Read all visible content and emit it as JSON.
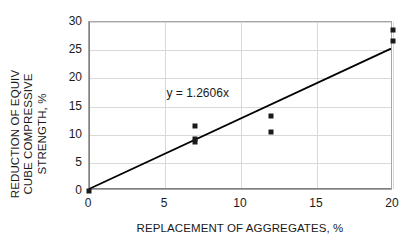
{
  "chart_data": {
    "type": "scatter",
    "title": "",
    "xlabel": "REPLACEMENT OF AGGREGATES, %",
    "ylabel": "REDUCTION OF EQUIV CUBE COMPRESSIVE STRENGTH, %",
    "ylabel_lines": [
      "REDUCTION OF EQUIV",
      "CUBE COMPRESSIVE",
      "STRENGTH, %"
    ],
    "xlim": [
      0,
      20
    ],
    "ylim": [
      0,
      30
    ],
    "xticks": [
      0,
      5,
      10,
      15,
      20
    ],
    "yticks": [
      0,
      5,
      10,
      15,
      20,
      25,
      30
    ],
    "xtick_labels": [
      "0",
      "5",
      "10",
      "15",
      "20"
    ],
    "ytick_labels": [
      "0",
      "5",
      "10",
      "15",
      "20",
      "25",
      "30"
    ],
    "grid": true,
    "legend": "none",
    "marker_color": "#1a1a1a",
    "line_color": "#000000",
    "grid_color": "#d9d9d9",
    "frame_color": "#a6a6a6",
    "points": [
      {
        "x": 0,
        "y": 0
      },
      {
        "x": 7,
        "y": 11.5
      },
      {
        "x": 7,
        "y": 9.2
      },
      {
        "x": 7,
        "y": 8.7
      },
      {
        "x": 12,
        "y": 13.4
      },
      {
        "x": 12,
        "y": 10.5
      },
      {
        "x": 20,
        "y": 28.5
      },
      {
        "x": 20,
        "y": 26.7
      }
    ],
    "trendline": {
      "equation": "y = 1.2606x",
      "slope": 1.2606,
      "intercept": 0,
      "x_start": 0,
      "y_start": 0,
      "x_end": 20,
      "y_end": 25.212
    },
    "annotations": [
      {
        "text": "y = 1.2606x",
        "x": 5.1,
        "y": 17.3
      }
    ]
  }
}
